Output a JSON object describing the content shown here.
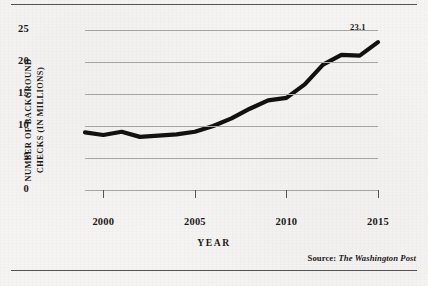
{
  "figure": {
    "y_axis_title": "NUMBER OF BACKGROUND\nCHECKS (IN MILLIONS)",
    "x_axis_title": "YEAR",
    "source_prefix": "Source:",
    "source_name": "The Washington Post",
    "endpoint_label": "23.1"
  },
  "chart_data": {
    "type": "line",
    "title": "",
    "xlabel": "YEAR",
    "ylabel": "NUMBER OF BACKGROUND CHECKS (IN MILLIONS)",
    "xlim": [
      1999,
      2015
    ],
    "ylim": [
      0,
      25
    ],
    "grid": true,
    "legend": false,
    "line_color": "#111111",
    "x": [
      1999,
      2000,
      2001,
      2002,
      2003,
      2004,
      2005,
      2006,
      2007,
      2008,
      2009,
      2010,
      2011,
      2012,
      2013,
      2014,
      2015
    ],
    "values": [
      9.0,
      8.6,
      9.1,
      8.3,
      8.5,
      8.7,
      9.1,
      10.0,
      11.2,
      12.7,
      14.0,
      14.4,
      16.5,
      19.6,
      21.1,
      21.0,
      23.1
    ],
    "x_tick_labels": [
      "2000",
      "2005",
      "2010",
      "2015"
    ],
    "x_tick_values": [
      2000,
      2005,
      2010,
      2015
    ],
    "y_tick_labels": [
      "0",
      "5",
      "10",
      "15",
      "20",
      "25"
    ],
    "y_tick_values": [
      0,
      5,
      10,
      15,
      20,
      25
    ],
    "annotations": [
      {
        "label": "23.1",
        "x": 2015,
        "y": 23.1
      }
    ],
    "source": "The Washington Post"
  }
}
